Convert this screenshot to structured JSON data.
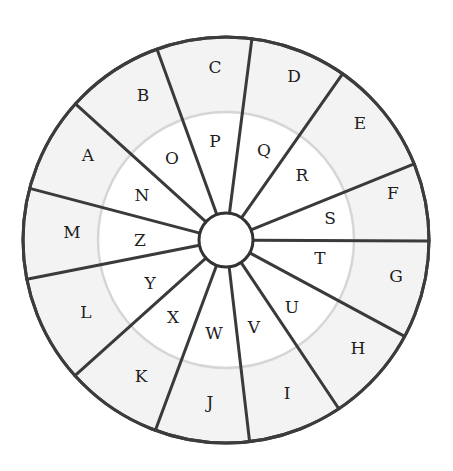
{
  "diagram": {
    "type": "cipher-wheel",
    "center": [
      226,
      240
    ],
    "outer_radius": 203,
    "inner_radius": 128,
    "hub_radius": 27,
    "colors": {
      "outer_ring_fill": "#f3f3f3",
      "inner_fill": "#ffffff",
      "stroke": "#3a3a3a",
      "inner_boundary": "#d6d6d6",
      "text": "#1e1e1e"
    },
    "spoke_ends": [
      [
        158,
        52
      ],
      [
        252,
        38
      ],
      [
        341,
        76
      ],
      [
        404,
        168
      ],
      [
        428,
        241
      ],
      [
        402,
        335
      ],
      [
        339,
        409
      ],
      [
        250,
        445
      ],
      [
        157,
        426
      ],
      [
        79,
        372
      ],
      [
        33,
        278
      ],
      [
        36,
        190
      ],
      [
        79,
        107
      ]
    ],
    "outer_letters": [
      {
        "char": "C",
        "x": 215,
        "y": 67
      },
      {
        "char": "D",
        "x": 294,
        "y": 76
      },
      {
        "char": "E",
        "x": 360,
        "y": 123
      },
      {
        "char": "F",
        "x": 393,
        "y": 193
      },
      {
        "char": "G",
        "x": 396,
        "y": 276
      },
      {
        "char": "H",
        "x": 358,
        "y": 348
      },
      {
        "char": "I",
        "x": 287,
        "y": 393
      },
      {
        "char": "J",
        "x": 210,
        "y": 402
      },
      {
        "char": "K",
        "x": 141,
        "y": 376
      },
      {
        "char": "L",
        "x": 86,
        "y": 312
      },
      {
        "char": "M",
        "x": 72,
        "y": 232
      },
      {
        "char": "A",
        "x": 88,
        "y": 155
      },
      {
        "char": "B",
        "x": 143,
        "y": 95
      }
    ],
    "inner_letters": [
      {
        "char": "P",
        "x": 215,
        "y": 141
      },
      {
        "char": "Q",
        "x": 264,
        "y": 150
      },
      {
        "char": "R",
        "x": 302,
        "y": 175
      },
      {
        "char": "S",
        "x": 330,
        "y": 218
      },
      {
        "char": "T",
        "x": 320,
        "y": 258
      },
      {
        "char": "U",
        "x": 292,
        "y": 307
      },
      {
        "char": "V",
        "x": 254,
        "y": 327
      },
      {
        "char": "W",
        "x": 214,
        "y": 333
      },
      {
        "char": "X",
        "x": 173,
        "y": 317
      },
      {
        "char": "Y",
        "x": 150,
        "y": 283
      },
      {
        "char": "Z",
        "x": 140,
        "y": 240
      },
      {
        "char": "N",
        "x": 142,
        "y": 195
      },
      {
        "char": "O",
        "x": 172,
        "y": 158
      }
    ]
  }
}
